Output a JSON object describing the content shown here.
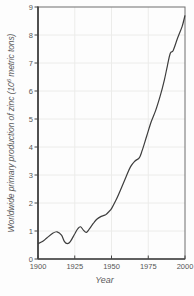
{
  "figure": {
    "background": "#fdfdfd",
    "frame_color": "#6e6e6e",
    "axis_color": "#454545",
    "grid_color": "#ececea",
    "curve_color": "#3d3d3d",
    "text_color": "#595959"
  },
  "chart_data": {
    "type": "line",
    "title": "",
    "xlabel": "Year",
    "ylabel": "Worldwide primary production of zinc (10^6 metric tons)",
    "ylabel_parts": {
      "prefix": "Worldwide primary production of zinc (10",
      "superscript": "6",
      "suffix": " metric tons)"
    },
    "xlim": [
      1900,
      2000
    ],
    "ylim": [
      0,
      9
    ],
    "xticks": [
      "1900",
      "1925",
      "1950",
      "1975",
      "2000"
    ],
    "yticks": [
      "9",
      "8",
      "7",
      "6",
      "5",
      "4",
      "3",
      "2",
      "1",
      "0"
    ],
    "grid": true,
    "legend": "none",
    "series": [
      {
        "name": "zinc-production",
        "x": [
          1900,
          1903,
          1906,
          1910,
          1913,
          1916,
          1918,
          1920,
          1922,
          1925,
          1927,
          1929,
          1931,
          1933,
          1935,
          1938,
          1940,
          1943,
          1946,
          1948,
          1950,
          1953,
          1956,
          1960,
          1963,
          1966,
          1969,
          1971,
          1974,
          1977,
          1980,
          1983,
          1986,
          1988,
          1990,
          1992,
          1995,
          1998,
          2000
        ],
        "y": [
          0.55,
          0.62,
          0.75,
          0.92,
          0.97,
          0.85,
          0.62,
          0.55,
          0.62,
          0.9,
          1.08,
          1.15,
          1.02,
          0.95,
          1.08,
          1.3,
          1.42,
          1.52,
          1.58,
          1.68,
          1.8,
          2.1,
          2.45,
          2.95,
          3.3,
          3.5,
          3.62,
          3.9,
          4.4,
          4.9,
          5.3,
          5.8,
          6.4,
          6.9,
          7.35,
          7.45,
          7.9,
          8.3,
          8.7
        ]
      }
    ]
  }
}
